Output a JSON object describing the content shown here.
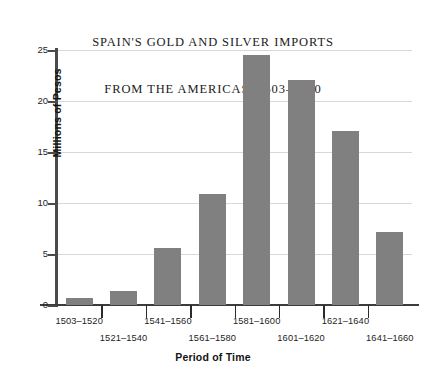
{
  "chart_data": {
    "type": "bar",
    "title": "SPAIN'S GOLD AND SILVER IMPORTS FROM THE AMERICAS, 1503–1660",
    "title_lines": [
      "SPAIN'S GOLD AND SILVER IMPORTS",
      "FROM THE AMERICAS, 1503–1660"
    ],
    "xlabel": "Period of Time",
    "ylabel": "Millions of Pesos",
    "categories": [
      "1503–1520",
      "1521–1540",
      "1541–1560",
      "1561–1580",
      "1581–1600",
      "1601–1620",
      "1621–1640",
      "1641–1660"
    ],
    "values": [
      0.7,
      1.4,
      5.6,
      10.9,
      24.5,
      22.1,
      17.1,
      7.2
    ],
    "ylim": [
      0,
      25
    ],
    "yticks": [
      0,
      5,
      10,
      15,
      20,
      25
    ],
    "ytick_labels": [
      "0",
      "5",
      "10",
      "15",
      "20",
      "25"
    ],
    "grid": true,
    "legend": "none",
    "bar_color": "#808080",
    "grid_color": "#d8d8d8",
    "axis_color": "#3c3c3c",
    "background": "#ffffff"
  }
}
